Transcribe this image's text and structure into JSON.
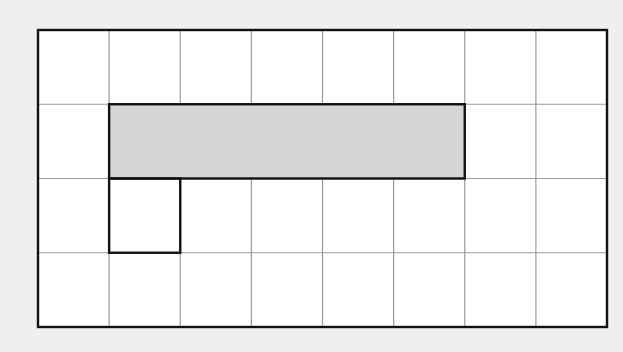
{
  "diagram": {
    "type": "grid-with-highlighted-shapes",
    "background_color": "#efefef",
    "grid": {
      "columns": 8,
      "rows": 4,
      "x": 38,
      "y": 30,
      "width": 569,
      "height": 297,
      "cell_fill": "#ffffff",
      "grid_line_color": "#9a9a9a",
      "border_color": "#111111"
    },
    "shapes": [
      {
        "id": "shaded-rectangle",
        "description": "Shaded rectangle spanning 5 columns x 1 row",
        "col_start": 1,
        "row_start": 1,
        "col_span": 5,
        "row_span": 1,
        "fill": "#d6d6d6",
        "stroke": "#111111"
      },
      {
        "id": "outlined-square",
        "description": "Unshaded outlined square 1 column x 1 row",
        "col_start": 1,
        "row_start": 2,
        "col_span": 1,
        "row_span": 1,
        "fill": "none",
        "stroke": "#111111"
      }
    ]
  }
}
